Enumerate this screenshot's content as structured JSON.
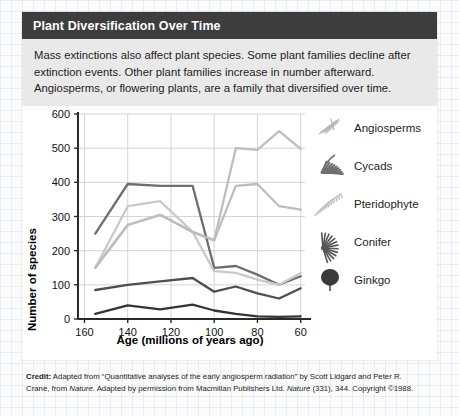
{
  "background": {
    "name": "graph-paper"
  },
  "card": {
    "title": "Plant Diversification Over Time",
    "intro": "Mass extinctions also affect plant species. Some plant families decline after extinction events. Other plant families  increase in number afterward. Angiosperms, or flowering plants, are a family that diversified over time.",
    "header_bg": "#3d3d3d",
    "intro_bg": "#e9e9e9"
  },
  "credit": {
    "label": "Credit:",
    "line1": " Adapted from “Quantitative analyses of the early angiosperm radiation” by Scott Lidgard and Peter R. Crane, from ",
    "italic1": "Nature",
    "line2": ". Adapted by permission from Macmillan Publishers Ltd. ",
    "italic2": "Nature",
    "line3": " (331), 344. Copyright ©1988."
  },
  "legend": {
    "items": [
      {
        "label": "Angiosperms",
        "icon": "angiosperm-leaf-icon",
        "color": "#b9b9b9"
      },
      {
        "label": "Cycads",
        "icon": "cycad-frond-icon",
        "color": "#6e6e6e"
      },
      {
        "label": "Pteridophyte",
        "icon": "fern-frond-icon",
        "color": "#c6c6c6"
      },
      {
        "label": "Conifer",
        "icon": "conifer-branch-icon",
        "color": "#555555"
      },
      {
        "label": "Ginkgo",
        "icon": "ginkgo-leaf-icon",
        "color": "#3a3a3a"
      }
    ]
  },
  "chart_data": {
    "type": "line",
    "title": "",
    "xlabel": "Age (millions of years ago)",
    "ylabel": "Number of species",
    "x": [
      155,
      140,
      125,
      110,
      100,
      90,
      80,
      70,
      60
    ],
    "xticks": [
      160,
      140,
      120,
      100,
      80,
      60
    ],
    "yticks": [
      0,
      100,
      200,
      300,
      400,
      500,
      600
    ],
    "xlim": [
      163,
      58
    ],
    "ylim": [
      0,
      600
    ],
    "x_axis_reversed": true,
    "grid": true,
    "legend_position": "right",
    "series": [
      {
        "name": "Angiosperms",
        "color": "#bdbdbd",
        "values": [
          150,
          275,
          305,
          255,
          230,
          390,
          395,
          330,
          320
        ]
      },
      {
        "name": "Cycads",
        "color": "#6e6e6e",
        "values": [
          250,
          395,
          390,
          390,
          150,
          155,
          130,
          100,
          125
        ]
      },
      {
        "name": "Pteridophyte",
        "color": "#c9c9c9",
        "values": [
          150,
          330,
          345,
          255,
          140,
          135,
          115,
          100,
          135
        ]
      },
      {
        "name": "Conifer",
        "color": "#4e4e4e",
        "values": [
          85,
          100,
          110,
          120,
          80,
          95,
          75,
          60,
          90
        ]
      },
      {
        "name": "Ginkgo",
        "color": "#353535",
        "values": [
          15,
          40,
          28,
          42,
          25,
          15,
          8,
          6,
          8
        ]
      }
    ],
    "angiosperm_track": {
      "note": "upper light curve rising to ~550 near 70 Ma",
      "x": [
        155,
        140,
        125,
        110,
        100,
        90,
        80,
        70,
        60
      ],
      "values": [
        150,
        275,
        305,
        255,
        230,
        500,
        495,
        550,
        498
      ]
    }
  }
}
